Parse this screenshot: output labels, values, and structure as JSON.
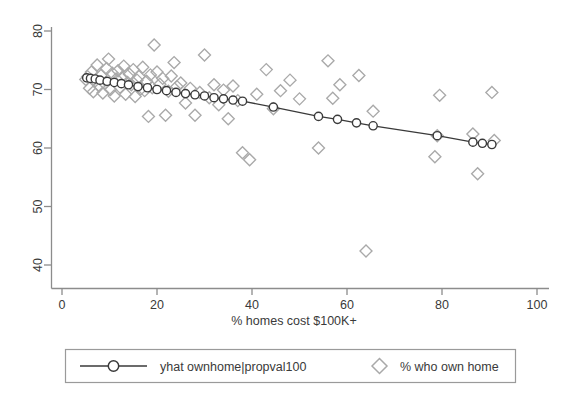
{
  "chart_data": {
    "type": "scatter",
    "title": "",
    "xlabel": "% homes cost $100K+",
    "ylabel": "",
    "xlim": [
      0,
      100
    ],
    "ylim": [
      40,
      80
    ],
    "xticks": [
      0,
      20,
      40,
      60,
      80,
      100
    ],
    "yticks": [
      40,
      50,
      60,
      70,
      80
    ],
    "grid": false,
    "legend_position": "bottom",
    "colors": {
      "scatter_marker": "#a9a9a9",
      "fit_line": "#3a3a3a",
      "fit_marker_fill": "#ffffff",
      "axis": "#8c8c8c",
      "text": "#3a3a3a",
      "legend_border": "#9a9a9a"
    },
    "series": [
      {
        "name": "yhat ownhome|propval100",
        "type": "line",
        "marker": "circle-open",
        "points": [
          [
            5.2,
            72.0
          ],
          [
            6.0,
            71.9
          ],
          [
            7.0,
            71.8
          ],
          [
            8.0,
            71.6
          ],
          [
            9.5,
            71.4
          ],
          [
            11.0,
            71.2
          ],
          [
            12.5,
            71.0
          ],
          [
            14.0,
            70.8
          ],
          [
            16.0,
            70.5
          ],
          [
            18.0,
            70.3
          ],
          [
            20.0,
            70.0
          ],
          [
            22.0,
            69.8
          ],
          [
            24.0,
            69.5
          ],
          [
            26.0,
            69.3
          ],
          [
            28.0,
            69.1
          ],
          [
            30.0,
            68.9
          ],
          [
            32.0,
            68.6
          ],
          [
            34.0,
            68.4
          ],
          [
            36.0,
            68.2
          ],
          [
            38.0,
            68.0
          ],
          [
            44.5,
            67.0
          ],
          [
            54.0,
            65.4
          ],
          [
            58.0,
            64.9
          ],
          [
            62.0,
            64.3
          ],
          [
            65.5,
            63.8
          ],
          [
            79.0,
            62.1
          ],
          [
            86.5,
            61.0
          ],
          [
            88.5,
            60.8
          ],
          [
            90.5,
            60.6
          ]
        ]
      },
      {
        "name": "% who own home",
        "type": "scatter",
        "marker": "diamond-open",
        "points": [
          [
            5.0,
            71.7
          ],
          [
            5.4,
            72.2
          ],
          [
            5.8,
            70.2
          ],
          [
            6.2,
            73.0
          ],
          [
            6.6,
            69.6
          ],
          [
            7.0,
            71.5
          ],
          [
            7.4,
            74.2
          ],
          [
            7.8,
            70.6
          ],
          [
            8.2,
            72.4
          ],
          [
            8.6,
            69.4
          ],
          [
            9.0,
            71.0
          ],
          [
            9.4,
            73.6
          ],
          [
            9.8,
            75.2
          ],
          [
            10.2,
            70.0
          ],
          [
            10.6,
            72.8
          ],
          [
            11.0,
            68.9
          ],
          [
            11.4,
            71.8
          ],
          [
            11.8,
            73.2
          ],
          [
            12.2,
            70.4
          ],
          [
            12.6,
            72.0
          ],
          [
            13.0,
            74.0
          ],
          [
            13.4,
            69.2
          ],
          [
            13.8,
            71.2
          ],
          [
            14.2,
            72.6
          ],
          [
            14.6,
            70.8
          ],
          [
            15.0,
            73.4
          ],
          [
            15.4,
            68.8
          ],
          [
            15.8,
            71.6
          ],
          [
            16.2,
            72.2
          ],
          [
            16.6,
            70.1
          ],
          [
            17.0,
            73.8
          ],
          [
            17.4,
            69.8
          ],
          [
            17.8,
            71.4
          ],
          [
            18.2,
            65.4
          ],
          [
            18.6,
            72.5
          ],
          [
            19.0,
            70.3
          ],
          [
            19.4,
            77.6
          ],
          [
            20.0,
            73.0
          ],
          [
            20.6,
            70.9
          ],
          [
            21.2,
            71.9
          ],
          [
            21.8,
            65.6
          ],
          [
            22.4,
            69.7
          ],
          [
            23.0,
            72.3
          ],
          [
            23.6,
            74.6
          ],
          [
            24.2,
            70.5
          ],
          [
            25.0,
            71.1
          ],
          [
            26.0,
            67.7
          ],
          [
            27.0,
            70.2
          ],
          [
            28.0,
            65.6
          ],
          [
            29.0,
            69.5
          ],
          [
            30.0,
            75.9
          ],
          [
            31.0,
            68.6
          ],
          [
            32.0,
            70.8
          ],
          [
            33.0,
            67.4
          ],
          [
            34.0,
            69.9
          ],
          [
            35.0,
            65.0
          ],
          [
            36.0,
            70.6
          ],
          [
            37.0,
            68.1
          ],
          [
            38.0,
            59.2
          ],
          [
            39.5,
            58.0
          ],
          [
            41.0,
            69.2
          ],
          [
            43.0,
            73.4
          ],
          [
            44.5,
            66.7
          ],
          [
            46.0,
            69.8
          ],
          [
            48.0,
            71.6
          ],
          [
            50.0,
            68.4
          ],
          [
            54.0,
            60.0
          ],
          [
            56.0,
            74.9
          ],
          [
            57.0,
            68.5
          ],
          [
            58.5,
            70.8
          ],
          [
            62.5,
            72.4
          ],
          [
            64.0,
            42.4
          ],
          [
            65.5,
            66.3
          ],
          [
            78.5,
            58.5
          ],
          [
            79.0,
            62.1
          ],
          [
            79.5,
            69.0
          ],
          [
            86.5,
            62.4
          ],
          [
            87.5,
            55.6
          ],
          [
            90.5,
            69.5
          ],
          [
            91.0,
            61.3
          ]
        ]
      }
    ]
  },
  "legend": {
    "entries": [
      {
        "label": "yhat ownhome|propval100",
        "marker": "line-circle"
      },
      {
        "label": "% who own home",
        "marker": "diamond"
      }
    ]
  },
  "axis": {
    "x_title": "% homes cost $100K+",
    "x_tick_labels": [
      "0",
      "20",
      "40",
      "60",
      "80",
      "100"
    ],
    "y_tick_labels": [
      "40",
      "50",
      "60",
      "70",
      "80"
    ]
  }
}
